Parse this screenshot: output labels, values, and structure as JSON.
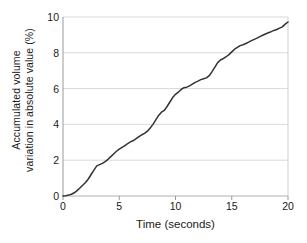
{
  "chart_data": {
    "type": "line",
    "title": "",
    "xlabel": "Time (seconds)",
    "ylabel": "Accumulated volume variation in absolute value (%)",
    "ylabel_line1": "Accumulated volume",
    "ylabel_line2": "variation in absolute value (%)",
    "xlim": [
      0,
      20
    ],
    "ylim": [
      0,
      10
    ],
    "xticks": [
      "0",
      "5",
      "10",
      "15",
      "20"
    ],
    "xtick_values": [
      0,
      5,
      10,
      15,
      20
    ],
    "yticks": [
      "0",
      "2",
      "4",
      "6",
      "8",
      "10"
    ],
    "ytick_values": [
      0,
      2,
      4,
      6,
      8,
      10
    ],
    "grid": "horizontal",
    "grid_color": "#d9d9d9",
    "legend": "none",
    "line_color": "#333333",
    "line_width": 1.5,
    "series": [
      {
        "name": "Accumulated volume variation",
        "x": [
          0.0,
          0.25,
          0.5,
          0.75,
          1.0,
          1.25,
          1.5,
          1.75,
          2.0,
          2.25,
          2.5,
          2.75,
          3.0,
          3.25,
          3.5,
          3.75,
          4.0,
          4.25,
          4.5,
          4.75,
          5.0,
          5.25,
          5.5,
          5.75,
          6.0,
          6.25,
          6.5,
          6.75,
          7.0,
          7.25,
          7.5,
          7.75,
          8.0,
          8.25,
          8.5,
          8.75,
          9.0,
          9.25,
          9.5,
          9.75,
          10.0,
          10.25,
          10.5,
          10.75,
          11.0,
          11.25,
          11.5,
          11.75,
          12.0,
          12.25,
          12.5,
          12.75,
          13.0,
          13.25,
          13.5,
          13.75,
          14.0,
          14.25,
          14.5,
          14.75,
          15.0,
          15.25,
          15.5,
          15.75,
          16.0,
          16.25,
          16.5,
          16.75,
          17.0,
          17.25,
          17.5,
          17.75,
          18.0,
          18.25,
          18.5,
          18.75,
          19.0,
          19.25,
          19.5,
          19.75,
          20.0
        ],
        "y": [
          0.0,
          0.02,
          0.05,
          0.1,
          0.18,
          0.3,
          0.45,
          0.6,
          0.75,
          0.95,
          1.2,
          1.45,
          1.68,
          1.75,
          1.82,
          1.92,
          2.05,
          2.2,
          2.35,
          2.5,
          2.62,
          2.72,
          2.82,
          2.92,
          3.02,
          3.1,
          3.2,
          3.32,
          3.42,
          3.5,
          3.62,
          3.8,
          4.0,
          4.25,
          4.5,
          4.68,
          4.78,
          5.0,
          5.25,
          5.5,
          5.68,
          5.8,
          5.95,
          6.05,
          6.08,
          6.15,
          6.25,
          6.35,
          6.42,
          6.5,
          6.55,
          6.6,
          6.72,
          6.95,
          7.2,
          7.45,
          7.6,
          7.68,
          7.78,
          7.9,
          8.05,
          8.2,
          8.3,
          8.4,
          8.45,
          8.52,
          8.6,
          8.68,
          8.75,
          8.82,
          8.9,
          8.98,
          9.05,
          9.12,
          9.18,
          9.25,
          9.3,
          9.38,
          9.45,
          9.6,
          9.72
        ]
      }
    ]
  }
}
